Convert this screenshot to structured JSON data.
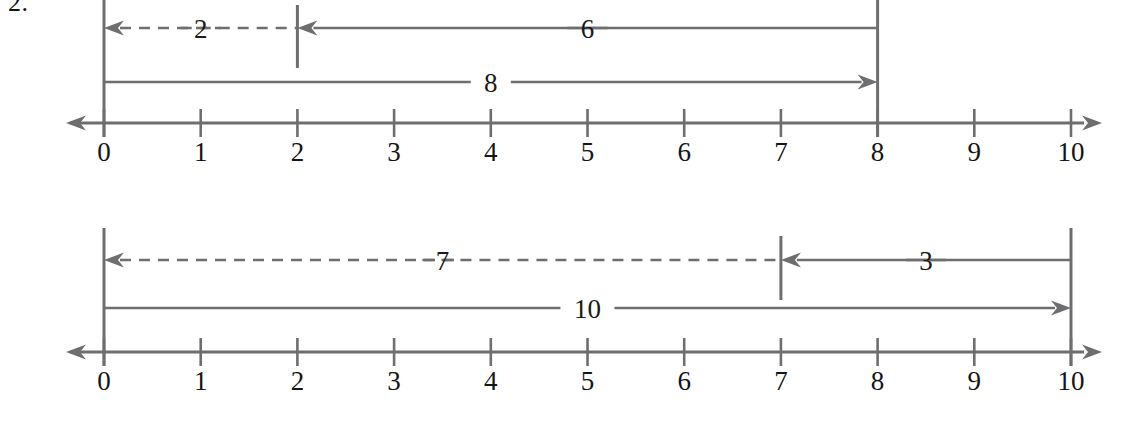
{
  "problem": {
    "number_label": "2."
  },
  "style": {
    "line_color": "#6e6e70",
    "text_color": "#151515",
    "background": "#ffffff"
  },
  "chart_data": [
    {
      "type": "line",
      "title": "",
      "xlabel": "",
      "ylabel": "",
      "axis": {
        "min": 0,
        "max": 10,
        "tick_step": 1,
        "tick_labels": [
          "0",
          "1",
          "2",
          "3",
          "4",
          "5",
          "6",
          "7",
          "8",
          "9",
          "10"
        ],
        "left_arrow": true,
        "right_arrow": true,
        "grid": false
      },
      "spans": [
        {
          "label": "2",
          "from": 2,
          "to": 0,
          "style": "dashed",
          "arrow": "left",
          "row": "upper"
        },
        {
          "label": "6",
          "from": 8,
          "to": 2,
          "style": "solid",
          "arrow": "left",
          "row": "upper"
        },
        {
          "label": "8",
          "from": 0,
          "to": 8,
          "style": "solid",
          "arrow": "right",
          "row": "lower"
        }
      ],
      "stems": [
        0,
        8
      ],
      "markers": [
        2
      ],
      "equation_read": "2 + 6 = 8"
    },
    {
      "type": "line",
      "title": "",
      "xlabel": "",
      "ylabel": "",
      "axis": {
        "min": 0,
        "max": 10,
        "tick_step": 1,
        "tick_labels": [
          "0",
          "1",
          "2",
          "3",
          "4",
          "5",
          "6",
          "7",
          "8",
          "9",
          "10"
        ],
        "left_arrow": true,
        "right_arrow": true,
        "grid": false
      },
      "spans": [
        {
          "label": "7",
          "from": 7,
          "to": 0,
          "style": "dashed",
          "arrow": "left",
          "row": "upper"
        },
        {
          "label": "3",
          "from": 10,
          "to": 7,
          "style": "solid",
          "arrow": "left",
          "row": "upper"
        },
        {
          "label": "10",
          "from": 0,
          "to": 10,
          "style": "solid",
          "arrow": "right",
          "row": "lower"
        }
      ],
      "stems": [
        0,
        10
      ],
      "markers": [
        7
      ],
      "equation_read": "7 + 3 = 10"
    }
  ]
}
